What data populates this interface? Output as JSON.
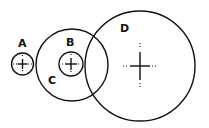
{
  "diagram": {
    "circles": [
      {
        "id": "A",
        "label": "A",
        "cx": 22.5,
        "cy": 64,
        "r": 11,
        "label_x": 18,
        "label_y": 47,
        "has_center_mark": true,
        "mark_size": 5
      },
      {
        "id": "B",
        "label": "B",
        "cx": 71,
        "cy": 64,
        "r": 12,
        "label_x": 66,
        "label_y": 46,
        "has_center_mark": true,
        "mark_size": 6
      },
      {
        "id": "C",
        "label": "C",
        "cx": 72,
        "cy": 65,
        "r": 36,
        "label_x": 48,
        "label_y": 84,
        "has_center_mark": false
      },
      {
        "id": "D",
        "label": "D",
        "cx": 140,
        "cy": 66,
        "r": 55,
        "label_x": 120,
        "label_y": 32,
        "has_center_mark": true,
        "mark_size": 11
      }
    ],
    "labels": {
      "a": "A",
      "b": "B",
      "c": "C",
      "d": "D"
    },
    "stroke_color": "#111111",
    "background": "#ffffff"
  }
}
